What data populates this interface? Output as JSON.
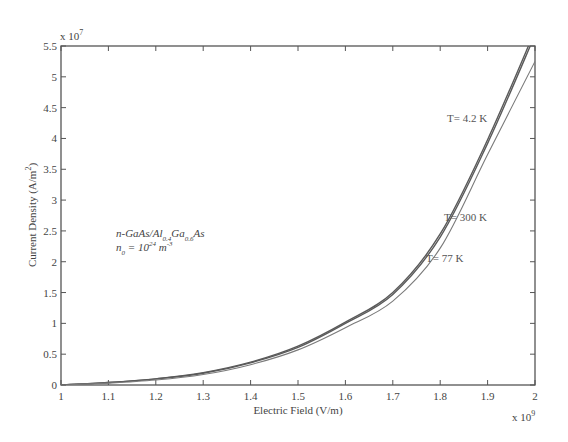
{
  "chart_data": {
    "type": "line",
    "title": "",
    "xlabel": "Electric Field (V/m)",
    "ylabel": "Current Density (A/m²)",
    "x_multiplier": "x 10^9",
    "y_multiplier": "x 10^7",
    "xlim": [
      1,
      2
    ],
    "ylim": [
      0,
      5.5
    ],
    "grid": false,
    "x_ticks": [
      "1",
      "1.1",
      "1.2",
      "1.3",
      "1.4",
      "1.5",
      "1.6",
      "1.7",
      "1.8",
      "1.9",
      "2"
    ],
    "y_ticks": [
      "0",
      "0.5",
      "1",
      "1.5",
      "2",
      "2.5",
      "3",
      "3.5",
      "4",
      "4.5",
      "5",
      "5.5"
    ],
    "x": [
      1.0,
      1.1,
      1.2,
      1.3,
      1.4,
      1.5,
      1.6,
      1.7,
      1.8,
      1.9,
      2.0
    ],
    "series": [
      {
        "name": "T= 4.2 K",
        "values": [
          0,
          0.04,
          0.1,
          0.2,
          0.37,
          0.63,
          1.02,
          1.5,
          2.45,
          3.98,
          5.75
        ]
      },
      {
        "name": "T= 300 K",
        "values": [
          0,
          0.04,
          0.1,
          0.19,
          0.36,
          0.61,
          1.0,
          1.47,
          2.4,
          3.92,
          5.68
        ]
      },
      {
        "name": "T= 77 K",
        "values": [
          0,
          0.03,
          0.08,
          0.17,
          0.33,
          0.57,
          0.93,
          1.36,
          2.22,
          3.74,
          5.25
        ]
      }
    ],
    "annotations": [
      {
        "text": "T= 4.2 K",
        "x": 1.82,
        "y": 4.3
      },
      {
        "text": "T= 300 K",
        "x": 1.81,
        "y": 2.7
      },
      {
        "text": "T= 77 K",
        "x": 1.77,
        "y": 2.05
      },
      {
        "text": "n-GaAs/Al0.4Ga0.6As",
        "x": 1.12,
        "y": 2.5
      },
      {
        "text": "n0 = 10^24 m^-3",
        "x": 1.12,
        "y": 2.2
      }
    ]
  },
  "labels": {
    "xlabel": "Electric Field (V/m)",
    "ylabel_main": "Current Density (A/m",
    "ylabel_sup": "2",
    "ylabel_end": ")",
    "x_mult_base": "x 10",
    "x_mult_exp": "9",
    "y_mult_base": "x 10",
    "y_mult_exp": "7",
    "curve_42": "T= 4.2 K",
    "curve_300": "T= 300 K",
    "curve_77": "T= 77 K",
    "material_a": "n-GaAs/Al",
    "material_sub1": "0.4",
    "material_b": "Ga",
    "material_sub2": "0.6",
    "material_c": "As",
    "density_a": "n",
    "density_sub": "0",
    "density_b": " = 10",
    "density_exp": "24",
    "density_c": " m",
    "density_exp2": "-3"
  },
  "colors": {
    "axis": "#555555",
    "curve_dark": "#5a5a5a",
    "curve_light": "#7a7a7a"
  }
}
